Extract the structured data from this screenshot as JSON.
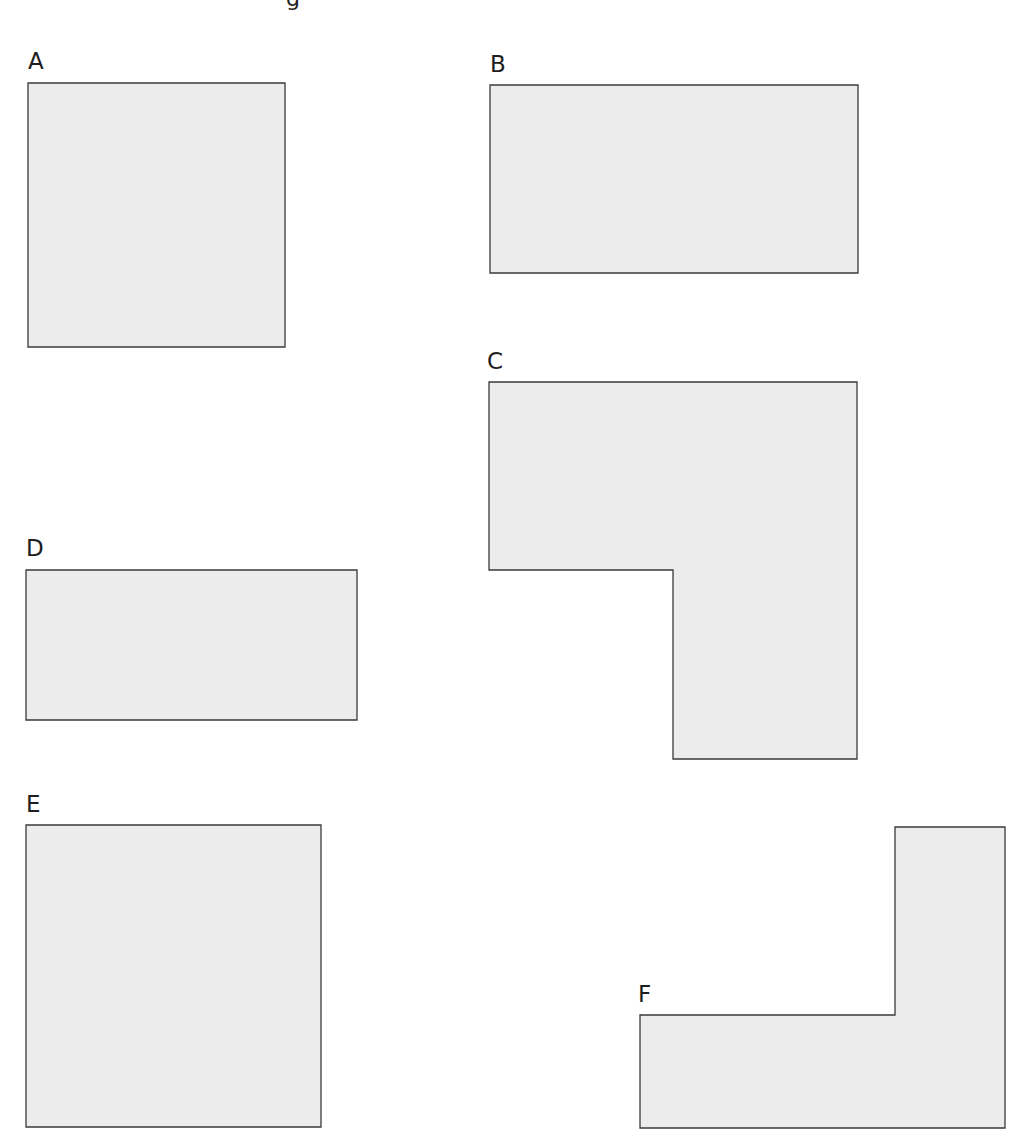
{
  "header": {
    "partial_text": "g"
  },
  "colors": {
    "fill": "#ececec",
    "stroke": "#3a3a3a",
    "text": "#1e1e1e"
  },
  "shapes": [
    {
      "label": "A",
      "type": "rectangle",
      "points": "28,83 285,83 285,347 28,347",
      "label_pos": [
        28,
        50
      ]
    },
    {
      "label": "B",
      "type": "rectangle",
      "points": "490,85 858,85 858,273 490,273",
      "label_pos": [
        490,
        53
      ]
    },
    {
      "label": "C",
      "type": "l-shape",
      "points": "489,382 857,382 857,759 673,759 673,570 489,570",
      "label_pos": [
        487,
        350
      ]
    },
    {
      "label": "D",
      "type": "rectangle",
      "points": "26,570 357,570 357,720 26,720",
      "label_pos": [
        26,
        537
      ]
    },
    {
      "label": "E",
      "type": "rectangle",
      "points": "26,825 321,825 321,1127 26,1127",
      "label_pos": [
        26,
        793
      ]
    },
    {
      "label": "F",
      "type": "l-shape",
      "points": "640,1015 895,1015 895,827 1005,827 1005,1128 640,1128",
      "label_pos": [
        638,
        983
      ]
    }
  ]
}
